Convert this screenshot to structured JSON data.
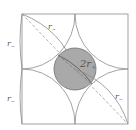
{
  "diagram": {
    "type": "geometry",
    "colors": {
      "stroke": "#8a8a8a",
      "circle_fill": "#a9a9a9",
      "circle_stroke": "#6e6e6e",
      "dashed": "#9a9a9a",
      "label": "#555555"
    },
    "labels": {
      "center_circle": "2r",
      "center_circle_sub": "+",
      "left_top": "r",
      "left_top_sub": "−",
      "left_bottom": "r",
      "left_bottom_sub": "−",
      "diag_top": "r",
      "diag_top_sub": "−",
      "diag_bottom": "r",
      "diag_bottom_sub": "−"
    }
  }
}
